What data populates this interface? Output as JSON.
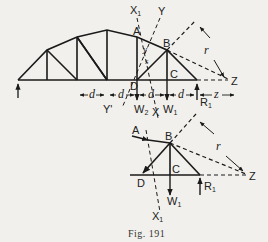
{
  "figure": {
    "caption": "Fig. 191",
    "upper_diagram": {
      "description": "Bowstring truss with section lines X1-X and Y-Y' and moment center Z",
      "labels": {
        "X1": "X",
        "X1_sub": "1",
        "Y": "Y",
        "A": "A",
        "B": "B",
        "C": "C",
        "D": "D",
        "Z": "Z",
        "r": "r",
        "s": "s",
        "y": "y",
        "Y_prime": "Y'",
        "X": "X",
        "W2": "W",
        "W2_sub": "2",
        "W1": "W",
        "W1_sub": "1",
        "R1": "R",
        "R1_sub": "1",
        "dims": [
          "d",
          "d",
          "d",
          "d",
          "z"
        ]
      }
    },
    "lower_diagram": {
      "description": "Free body of truss portion to right of section X1-X",
      "labels": {
        "A": "A",
        "B": "B",
        "C": "C",
        "D": "D",
        "Z": "Z",
        "r": "r",
        "W1": "W",
        "W1_sub": "1",
        "R1": "R",
        "R1_sub": "1",
        "X1": "X",
        "X1_sub": "1"
      }
    }
  },
  "colors": {
    "background": "#f1f0ec",
    "ink": "#1a1a1a"
  }
}
